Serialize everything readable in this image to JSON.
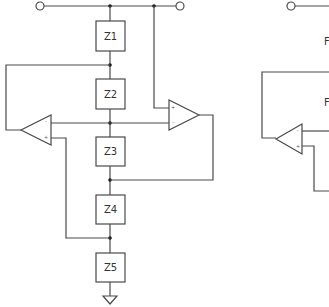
{
  "diagram": {
    "type": "circuit-schematic",
    "left_circuit": {
      "impedances": [
        {
          "id": "z1",
          "label": "Z1"
        },
        {
          "id": "z2",
          "label": "Z2"
        },
        {
          "id": "z3",
          "label": "Z3"
        },
        {
          "id": "z4",
          "label": "Z4"
        },
        {
          "id": "z5",
          "label": "Z5"
        }
      ],
      "opamps": [
        {
          "id": "opamp-left",
          "minus": "-",
          "plus": "+"
        },
        {
          "id": "opamp-right",
          "minus": "-",
          "plus": "+"
        }
      ],
      "terminals": [
        "input-terminal",
        "output-terminal"
      ],
      "ground": "ground-symbol"
    },
    "right_circuit_partial": {
      "labels": [
        "F",
        "F"
      ],
      "opamp": {
        "minus": "-",
        "plus": "+"
      }
    },
    "colors": {
      "line": "#4a4a4a",
      "node": "#1a1a1a",
      "text": "#333333"
    }
  }
}
